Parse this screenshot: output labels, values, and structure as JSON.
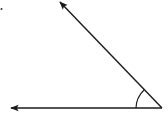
{
  "diagram": {
    "type": "angle",
    "stroke_color": "#1a1a1a",
    "background": "#ffffff",
    "vertex": {
      "x": 162,
      "y": 108
    },
    "rays": [
      {
        "name": "horizontal-ray",
        "from": {
          "x": 162,
          "y": 108
        },
        "to": {
          "x": 10,
          "y": 108
        }
      },
      {
        "name": "slanted-ray",
        "from": {
          "x": 162,
          "y": 108
        },
        "to": {
          "x": 60,
          "y": 2
        }
      }
    ],
    "angle_arc": {
      "radius": 26
    },
    "marker_dot": {
      "x": 1,
      "y": 9
    }
  }
}
